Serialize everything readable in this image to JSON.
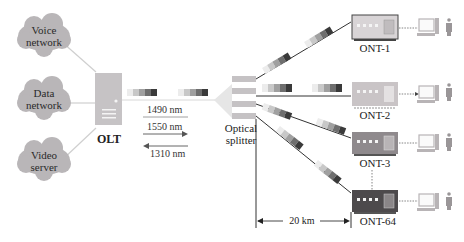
{
  "clouds": [
    {
      "label_line1": "Voice",
      "label_line2": "network"
    },
    {
      "label_line1": "Data",
      "label_line2": "network"
    },
    {
      "label_line1": "Video",
      "label_line2": "server"
    }
  ],
  "olt": {
    "label": "OLT"
  },
  "wavelengths": {
    "down1": "1490 nm",
    "down2": "1550 nm",
    "up": "1310 nm"
  },
  "splitter": {
    "label_line1": "Optical",
    "label_line2": "splitter"
  },
  "onts": [
    {
      "label": "ONT-1",
      "color": "#d8d4d6"
    },
    {
      "label": "ONT-2",
      "color": "#c9c4c6"
    },
    {
      "label": "ONT-3",
      "color": "#8f8a8d"
    },
    {
      "label": "ONT-64",
      "color": "#4d4a4c"
    }
  ],
  "distance": {
    "label": "20 km"
  },
  "colors": {
    "cloud": "#b9b6b8",
    "olt": "#c6c3c5",
    "packet_shades": [
      "#ececec",
      "#c8c8c8",
      "#a0a0a0",
      "#6e6e6e",
      "#3a3a3a"
    ],
    "line": "#333333"
  }
}
